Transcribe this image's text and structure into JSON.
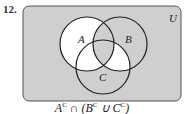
{
  "problem": {
    "number": "12."
  },
  "diagram": {
    "universe_label": "U",
    "sets": [
      {
        "label": "A",
        "cx": 87,
        "cy": 44,
        "r": 27
      },
      {
        "label": "B",
        "cx": 120,
        "cy": 44,
        "r": 27
      },
      {
        "label": "C",
        "cx": 103,
        "cy": 67,
        "r": 27
      }
    ],
    "shading_color": "#cfcfcf",
    "unshaded_color": "#ffffff",
    "outline_color": "#222222",
    "unshaded_regions": [
      "A only",
      "A∩C not B",
      "B∩C not A"
    ],
    "shaded_regions": [
      "outside",
      "B only",
      "C only",
      "A∩B not C",
      "A∩B∩C"
    ]
  },
  "caption": {
    "a": "A",
    "sup1": "C",
    "op1": " ∩ (",
    "b": "B",
    "sup2": "C",
    "op2": " ∪ ",
    "c": "C",
    "sup3": "C",
    "close": ")"
  }
}
